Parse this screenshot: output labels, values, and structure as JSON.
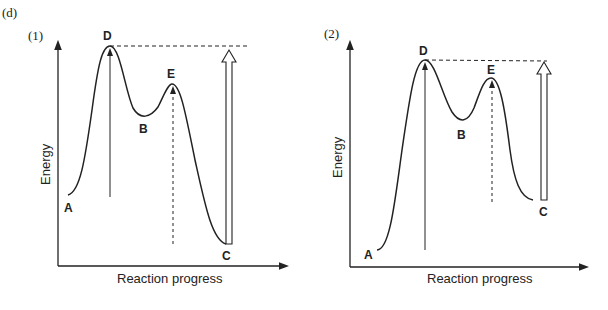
{
  "figure": {
    "label": "(d)",
    "panels": [
      {
        "tag": "(1)",
        "xlabel": "Reaction progress",
        "ylabel": "Energy",
        "points": {
          "A": "A",
          "B": "B",
          "C": "C",
          "D": "D",
          "E": "E"
        }
      },
      {
        "tag": "(2)",
        "xlabel": "Reaction progress",
        "ylabel": "Energy",
        "points": {
          "A": "A",
          "B": "B",
          "C": "C",
          "D": "D",
          "E": "E"
        }
      }
    ]
  },
  "colors": {
    "line": "#222222",
    "background": "#ffffff"
  }
}
